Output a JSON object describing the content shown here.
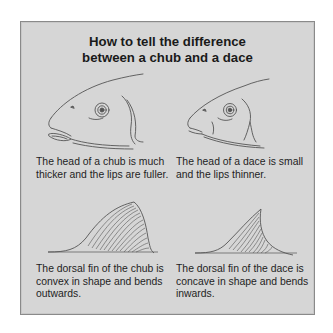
{
  "title": {
    "line1": "How to tell the difference",
    "line2": "between a chub and a dace"
  },
  "panels": [
    {
      "subject": "chub-head",
      "caption": "The head of a chub is much thicker and the lips are fuller."
    },
    {
      "subject": "dace-head",
      "caption": "The head of a dace is small and the lips thinner."
    },
    {
      "subject": "chub-dorsal-fin",
      "caption": "The dorsal fin of the chub is convex in shape and bends outwards."
    },
    {
      "subject": "dace-dorsal-fin",
      "caption": "The dorsal fin of the dace is concave in shape and bends inwards."
    }
  ],
  "colors": {
    "panel_background": "#d6d6d6",
    "panel_border": "#8a8a8a",
    "text": "#1a1a1a",
    "line_art": "#555555"
  }
}
